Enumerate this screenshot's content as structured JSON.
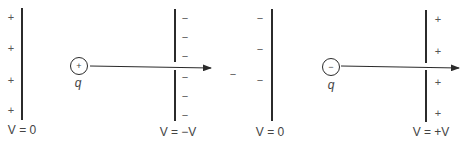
{
  "diagram": {
    "left_panel": {
      "plate_left": {
        "signs": [
          "+",
          "+",
          "+",
          "+"
        ],
        "potential_label": "V = 0"
      },
      "charge": {
        "sign": "+",
        "label": "q"
      },
      "plate_right": {
        "signs": [
          "−",
          "−",
          "−",
          "−",
          "−",
          "−"
        ],
        "potential_label": "V = −V"
      }
    },
    "stray_sign": "−",
    "right_panel": {
      "plate_left": {
        "signs": [
          "−",
          "−",
          "−"
        ],
        "potential_label": "V = 0"
      },
      "charge": {
        "sign": "−",
        "label": "q"
      },
      "plate_right": {
        "signs": [
          "+",
          "+",
          "+",
          "+"
        ],
        "potential_label": "V = +V"
      }
    },
    "colors": {
      "line": "#2b2b2b",
      "text": "#444444",
      "background": "#ffffff"
    }
  }
}
